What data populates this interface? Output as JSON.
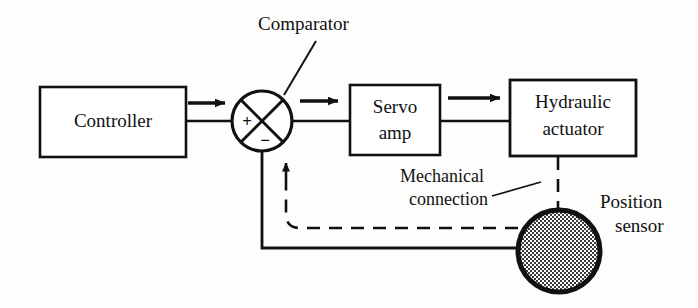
{
  "diagram": {
    "background_color": "#fdfdfc",
    "ink_color": "#111111",
    "blocks": [
      {
        "id": "controller",
        "label": "Controller",
        "x": 40,
        "y": 87,
        "w": 146,
        "h": 70
      },
      {
        "id": "servo_amp",
        "label_line1": "Servo",
        "label_line2": "amp",
        "x": 350,
        "y": 85,
        "w": 90,
        "h": 70
      },
      {
        "id": "hydraulic_actuator",
        "label_line1": "Hydraulic",
        "label_line2": "actuator",
        "x": 510,
        "y": 80,
        "w": 126,
        "h": 76
      }
    ],
    "comparator": {
      "label": "Comparator",
      "plus_sign": "+",
      "minus_sign": "−",
      "cx": 262,
      "cy": 121,
      "r": 30
    },
    "sensor": {
      "label_line1": "Position",
      "label_line2": "sensor",
      "cx": 559,
      "cy": 251,
      "r": 41,
      "fill_pattern": "stipple-dots"
    },
    "annotations": [
      {
        "id": "mechanical_connection",
        "line1": "Mechanical",
        "line2": "connection"
      }
    ],
    "signals": {
      "forward_arrow_count": 3,
      "feedback_arrow_label": "feedback-up-arrow",
      "mechanical_link_style": "dashed",
      "feedback_line_style": "solid"
    }
  }
}
